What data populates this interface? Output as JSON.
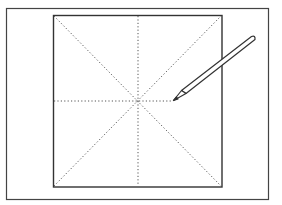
{
  "diagram": {
    "stroke_color": "#333333",
    "guide_color": "#555555",
    "outer_frame": {
      "x": 6,
      "y": 8,
      "width": 263,
      "height": 192
    },
    "inner_square": {
      "x": 53,
      "y": 15,
      "width": 169,
      "height": 172
    },
    "center": {
      "x": 138,
      "y": 101
    },
    "pencil": {
      "tip": {
        "x": 173,
        "y": 100
      },
      "end": {
        "x": 254,
        "y": 39
      }
    }
  }
}
